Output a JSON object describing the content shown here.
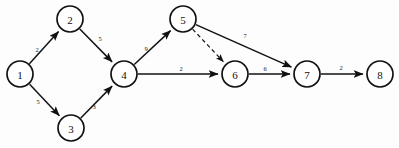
{
  "diagram": {
    "type": "directed-graph",
    "width": 399,
    "height": 148,
    "colors": {
      "background": "#fdfdfd",
      "stroke": "#111111",
      "node_fill": "#ffffff",
      "label": "#1a1a1a"
    },
    "nodes": [
      {
        "id": "1",
        "label": "1",
        "cx": 20,
        "cy": 74,
        "r": 13
      },
      {
        "id": "2",
        "label": "2",
        "cx": 70,
        "cy": 19,
        "r": 13
      },
      {
        "id": "3",
        "label": "3",
        "cx": 71,
        "cy": 128,
        "r": 13
      },
      {
        "id": "4",
        "label": "4",
        "cx": 124,
        "cy": 74,
        "r": 13
      },
      {
        "id": "5",
        "label": "5",
        "cx": 183,
        "cy": 19,
        "r": 13
      },
      {
        "id": "6",
        "label": "6",
        "cx": 235,
        "cy": 74,
        "r": 13
      },
      {
        "id": "7",
        "label": "7",
        "cx": 307,
        "cy": 74,
        "r": 13
      },
      {
        "id": "8",
        "label": "8",
        "cx": 380,
        "cy": 74,
        "r": 13
      }
    ],
    "edges": [
      {
        "id": "e1",
        "from": "1",
        "to": "2",
        "weight": "2",
        "style": "solid",
        "lx": 37,
        "ly": 49
      },
      {
        "id": "e2",
        "from": "2",
        "to": "4",
        "weight": "5",
        "style": "solid",
        "lx": 100,
        "ly": 38
      },
      {
        "id": "e3",
        "from": "1",
        "to": "3",
        "weight": "5",
        "style": "solid",
        "lx": 38,
        "ly": 101
      },
      {
        "id": "e4",
        "from": "3",
        "to": "4",
        "weight": "3",
        "style": "solid",
        "lx": 94,
        "ly": 106
      },
      {
        "id": "e5",
        "from": "4",
        "to": "5",
        "weight": "9",
        "style": "solid",
        "lx": 146,
        "ly": 48
      },
      {
        "id": "e6",
        "from": "4",
        "to": "6",
        "weight": "2",
        "style": "solid",
        "lx": 181,
        "ly": 68
      },
      {
        "id": "e7",
        "from": "5",
        "to": "6",
        "weight": "",
        "style": "dashed",
        "lx": 216,
        "ly": 46
      },
      {
        "id": "e8",
        "from": "5",
        "to": "7",
        "weight": "7",
        "style": "solid",
        "lx": 245,
        "ly": 35
      },
      {
        "id": "e9",
        "from": "6",
        "to": "7",
        "weight": "6",
        "style": "solid",
        "lx": 265,
        "ly": 68
      },
      {
        "id": "e10",
        "from": "7",
        "to": "8",
        "weight": "2",
        "style": "solid",
        "lx": 341,
        "ly": 67
      }
    ]
  }
}
